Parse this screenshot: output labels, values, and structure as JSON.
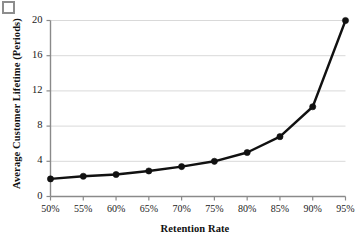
{
  "figure": {
    "corner_mark": "page-corner-artifact"
  },
  "chart_data": {
    "type": "line",
    "title": "",
    "xlabel": "Retention Rate",
    "ylabel": "Average Customer Lifetime (Periods)",
    "categories": [
      "50%",
      "55%",
      "60%",
      "65%",
      "70%",
      "75%",
      "80%",
      "85%",
      "90%",
      "95%"
    ],
    "x_numeric": [
      50,
      55,
      60,
      65,
      70,
      75,
      80,
      85,
      90,
      95
    ],
    "values": [
      2.0,
      2.3,
      2.5,
      2.9,
      3.4,
      4.0,
      5.0,
      6.8,
      10.2,
      20.0
    ],
    "series": [
      {
        "name": "Average Customer Lifetime",
        "values": [
          2.0,
          2.3,
          2.5,
          2.9,
          3.4,
          4.0,
          5.0,
          6.8,
          10.2,
          20.0
        ]
      }
    ],
    "ylim": [
      0,
      20
    ],
    "xlim": [
      50,
      95
    ],
    "yticks": [
      0,
      4,
      8,
      12,
      16,
      20
    ],
    "ytick_labels": [
      "0",
      "4",
      "8",
      "12",
      "16",
      "20"
    ],
    "xtick_labels": [
      "50%",
      "55%",
      "60%",
      "65%",
      "70%",
      "75%",
      "80%",
      "85%",
      "90%",
      "95%"
    ],
    "grid": "horizontal",
    "legend": "none",
    "line_color": "#111111",
    "marker": "circle",
    "marker_color": "#111111",
    "grid_color": "#d9d9d9",
    "axis_color": "#8a8a8a"
  }
}
